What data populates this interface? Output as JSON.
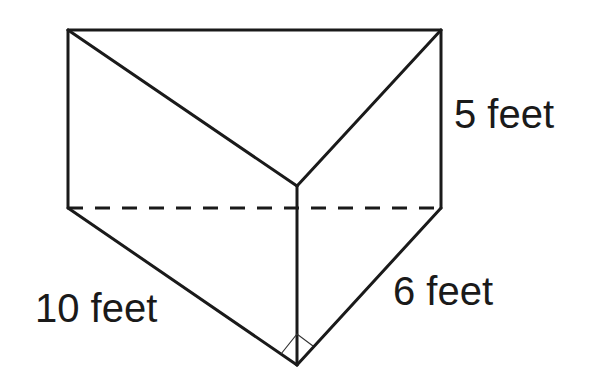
{
  "figure": {
    "type": "triangular-prism",
    "labels": {
      "height": "5 feet",
      "hypotenuse": "10 feet",
      "leg": "6 feet"
    },
    "right_angle_marker": true,
    "hidden_edge": "dashed"
  }
}
